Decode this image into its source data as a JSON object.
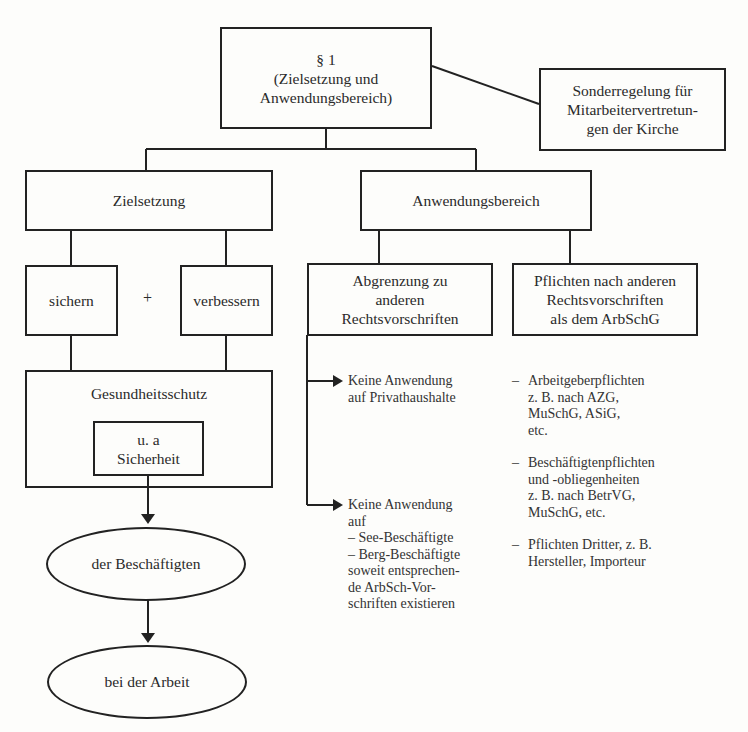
{
  "diagram": {
    "root": {
      "line1": "§ 1",
      "line2": "(Zielsetzung und",
      "line3": "Anwendungsbereich)"
    },
    "special": {
      "line1": "Sonderregelung für",
      "line2": "Mitarbeitervertretun-",
      "line3": "gen der Kirche"
    },
    "goal": {
      "label": "Zielsetzung"
    },
    "scope": {
      "label": "Anwendungsbereich"
    },
    "secure": {
      "label": "sichern"
    },
    "plus": {
      "label": "+"
    },
    "improve": {
      "label": "verbessern"
    },
    "health": {
      "label": "Gesundheitsschutz"
    },
    "safety": {
      "line1": "u. a",
      "line2": "Sicherheit"
    },
    "employees": {
      "label": "der Beschäftigten"
    },
    "work": {
      "label": "bei der Arbeit"
    },
    "delimitation": {
      "line1": "Abgrenzung zu",
      "line2": "anderen",
      "line3": "Rechtsvorschriften"
    },
    "duties": {
      "line1": "Pflichten nach anderen",
      "line2": "Rechtsvorschriften",
      "line3": "als dem ArbSchG"
    },
    "exclusion1": {
      "line1": "Keine Anwendung",
      "line2": "auf Privathaushalte"
    },
    "exclusion2": {
      "line1": "Keine Anwendung",
      "line2": "auf",
      "line3": "– See-Beschäftigte",
      "line4": "– Berg-Beschäftigte",
      "line5": "soweit entsprechen-",
      "line6": "de ArbSch-Vor-",
      "line7": "schriften existieren"
    },
    "duties_list": [
      {
        "dash": "–",
        "lines": [
          "Arbeitgeberpflichten",
          "z. B. nach AZG,",
          "MuSchG, ASiG,",
          "etc."
        ]
      },
      {
        "dash": "–",
        "lines": [
          "Beschäftigtenpflichten",
          "und -obliegenheiten",
          "z. B. nach BetrVG,",
          "MuSchG, etc."
        ]
      },
      {
        "dash": "–",
        "lines": [
          "Pflichten Dritter, z. B.",
          "Hersteller, Importeur"
        ]
      }
    ]
  }
}
